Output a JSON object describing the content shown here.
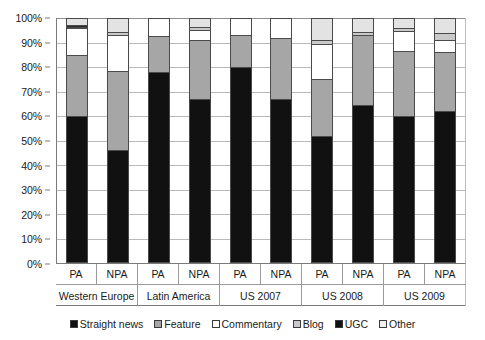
{
  "chart_data": {
    "type": "bar",
    "subtype": "stacked-percentage-column",
    "title": "",
    "xlabel": "",
    "ylabel": "",
    "ylim": [
      0,
      100
    ],
    "y_unit": "%",
    "grid": true,
    "legend_position": "bottom",
    "y_ticks": [
      "0%",
      "10%",
      "20%",
      "30%",
      "40%",
      "50%",
      "60%",
      "70%",
      "80%",
      "90%",
      "100%"
    ],
    "y_tick_values": [
      0,
      10,
      20,
      30,
      40,
      50,
      60,
      70,
      80,
      90,
      100
    ],
    "categories": [
      "PA",
      "NPA",
      "PA",
      "NPA",
      "PA",
      "NPA",
      "PA",
      "NPA",
      "PA",
      "NPA"
    ],
    "groups": [
      {
        "label": "Western Europe",
        "span": 2
      },
      {
        "label": "Latin America",
        "span": 2
      },
      {
        "label": "US 2007",
        "span": 2
      },
      {
        "label": "US 2008",
        "span": 2
      },
      {
        "label": "US 2009",
        "span": 2
      }
    ],
    "series": [
      {
        "name": "Straight news",
        "color": "#111111",
        "values": [
          60,
          46,
          78,
          67,
          80,
          67,
          52,
          64.5,
          60,
          62
        ]
      },
      {
        "name": "Feature",
        "color": "#a6a6a6",
        "values": [
          25,
          32.5,
          14.5,
          24,
          13,
          25,
          23,
          28.5,
          26.5,
          24
        ]
      },
      {
        "name": "Commentary",
        "color": "#ffffff",
        "values": [
          11,
          14.5,
          7.5,
          4,
          7,
          8,
          14.5,
          0,
          8,
          5
        ]
      },
      {
        "name": "Blog",
        "color": "#c9c9c9",
        "values": [
          0.5,
          1.5,
          0,
          1.5,
          0,
          0,
          1.5,
          1.5,
          1.5,
          3
        ]
      },
      {
        "name": "UGC",
        "color": "#2b2b2b",
        "values": [
          0.5,
          0,
          0,
          0,
          0,
          0,
          0,
          0,
          0,
          0
        ]
      },
      {
        "name": "Other",
        "color": "#e3e3e3",
        "values": [
          3,
          5.5,
          0,
          3.5,
          0,
          0,
          9,
          5.5,
          4,
          6
        ]
      }
    ]
  },
  "legend": {
    "items": [
      {
        "label": "Straight news",
        "color": "#111111"
      },
      {
        "label": "Feature",
        "color": "#a6a6a6"
      },
      {
        "label": "Commentary",
        "color": "#ffffff"
      },
      {
        "label": "Blog",
        "color": "#c9c9c9"
      },
      {
        "label": "UGC",
        "color": "#111111"
      },
      {
        "label": "Other",
        "color": "#f0f0f0"
      }
    ]
  }
}
